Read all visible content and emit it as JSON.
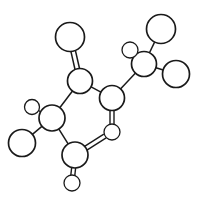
{
  "figure": {
    "kind": "molecular-structure-diagram",
    "style": "line-drawing",
    "background_color": "#ffffff",
    "stroke_color": "#1a1a1a",
    "fill_color": "#ffffff",
    "canvas": {
      "width": 199,
      "height": 206
    }
  },
  "molecule": {
    "atom_count": 13,
    "bond_count": 13,
    "atoms": [
      {
        "id": "a1",
        "label": "",
        "role": "terminal-large",
        "cx": 70,
        "cy": 37,
        "r": 14.5,
        "stroke_width": 1.7
      },
      {
        "id": "a2",
        "label": "",
        "role": "backbone",
        "cx": 80,
        "cy": 81,
        "r": 12.5,
        "stroke_width": 1.7
      },
      {
        "id": "a3",
        "label": "",
        "role": "backbone",
        "cx": 112,
        "cy": 98,
        "r": 12.5,
        "stroke_width": 1.7
      },
      {
        "id": "a4",
        "label": "",
        "role": "terminal-small",
        "cx": 112,
        "cy": 132,
        "r": 8.0,
        "stroke_width": 1.3
      },
      {
        "id": "a5",
        "label": "",
        "role": "branch",
        "cx": 144,
        "cy": 64,
        "r": 12.5,
        "stroke_width": 1.7
      },
      {
        "id": "a6",
        "label": "",
        "role": "terminal-small",
        "cx": 130,
        "cy": 50,
        "r": 8.0,
        "stroke_width": 1.3
      },
      {
        "id": "a7",
        "label": "",
        "role": "terminal-large",
        "cx": 161,
        "cy": 29,
        "r": 14.5,
        "stroke_width": 1.7
      },
      {
        "id": "a8",
        "label": "",
        "role": "terminal-large",
        "cx": 176,
        "cy": 74,
        "r": 13.5,
        "stroke_width": 1.7
      },
      {
        "id": "a9",
        "label": "",
        "role": "branch",
        "cx": 52,
        "cy": 118,
        "r": 13.0,
        "stroke_width": 1.7
      },
      {
        "id": "a10",
        "label": "",
        "role": "terminal-small",
        "cx": 32,
        "cy": 107,
        "r": 7.5,
        "stroke_width": 1.3
      },
      {
        "id": "a11",
        "label": "",
        "role": "terminal-large",
        "cx": 22,
        "cy": 143,
        "r": 13.5,
        "stroke_width": 1.7
      },
      {
        "id": "a12",
        "label": "",
        "role": "backbone",
        "cx": 75,
        "cy": 155,
        "r": 13.0,
        "stroke_width": 1.7
      },
      {
        "id": "a13",
        "label": "",
        "role": "terminal-small",
        "cx": 72,
        "cy": 183,
        "r": 8.0,
        "stroke_width": 1.3
      }
    ],
    "bonds": [
      {
        "id": "b1",
        "from": "a2",
        "to": "a1",
        "order": 2,
        "offset": 2.3,
        "stroke_width": 1.5
      },
      {
        "id": "b2",
        "from": "a2",
        "to": "a3",
        "order": 1,
        "offset": 2.6,
        "stroke_width": 1.5
      },
      {
        "id": "b3",
        "from": "a2",
        "to": "a9",
        "order": 1,
        "offset": 2.6,
        "stroke_width": 1.5
      },
      {
        "id": "b4",
        "from": "a3",
        "to": "a5",
        "order": 1,
        "offset": 2.6,
        "stroke_width": 1.5
      },
      {
        "id": "b5",
        "from": "a3",
        "to": "a4",
        "order": 2,
        "offset": 2.0,
        "stroke_width": 1.4
      },
      {
        "id": "b6",
        "from": "a5",
        "to": "a6",
        "order": 1,
        "offset": 2.0,
        "stroke_width": 1.4
      },
      {
        "id": "b7",
        "from": "a5",
        "to": "a7",
        "order": 1,
        "offset": 2.6,
        "stroke_width": 1.5
      },
      {
        "id": "b8",
        "from": "a5",
        "to": "a8",
        "order": 1,
        "offset": 2.6,
        "stroke_width": 1.5
      },
      {
        "id": "b9",
        "from": "a9",
        "to": "a10",
        "order": 1,
        "offset": 1.8,
        "stroke_width": 1.4
      },
      {
        "id": "b10",
        "from": "a9",
        "to": "a11",
        "order": 1,
        "offset": 2.4,
        "stroke_width": 1.5
      },
      {
        "id": "b11",
        "from": "a9",
        "to": "a12",
        "order": 1,
        "offset": 2.6,
        "stroke_width": 1.5
      },
      {
        "id": "b12",
        "from": "a12",
        "to": "a13",
        "order": 2,
        "offset": 2.0,
        "stroke_width": 1.4
      },
      {
        "id": "b13",
        "from": "a12",
        "to": "stub1",
        "order": 2,
        "offset": 2.2,
        "stroke_width": 1.4
      }
    ],
    "stubs": [
      {
        "id": "stub1",
        "cx": 105,
        "cy": 136,
        "r": 0
      }
    ]
  }
}
